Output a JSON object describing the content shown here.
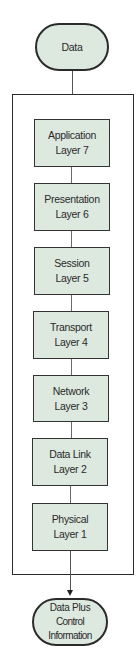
{
  "diagram": {
    "input": {
      "label": "Data"
    },
    "layers": [
      {
        "name": "Application",
        "layer": "Layer 7"
      },
      {
        "name": "Presentation",
        "layer": "Layer 6"
      },
      {
        "name": "Session",
        "layer": "Layer 5"
      },
      {
        "name": "Transport",
        "layer": "Layer 4"
      },
      {
        "name": "Network",
        "layer": "Layer 3"
      },
      {
        "name": "Data Link",
        "layer": "Layer 2"
      },
      {
        "name": "Physical",
        "layer": "Layer 1"
      }
    ],
    "output": {
      "line1": "Data Plus",
      "line2": "Control Information"
    },
    "colors": {
      "fill": "#dde8df",
      "stroke": "#2b2b2b"
    }
  }
}
